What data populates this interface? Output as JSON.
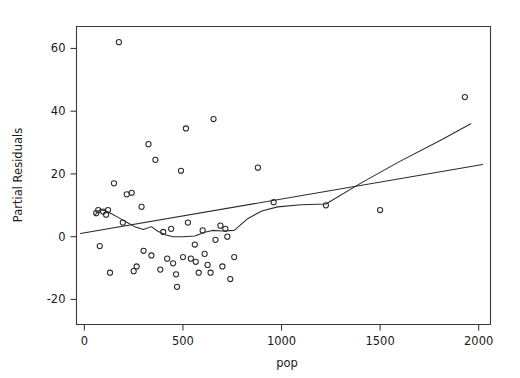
{
  "chart_data": {
    "type": "scatter",
    "title": "",
    "subtitle": "",
    "xlabel": "pop",
    "ylabel": "Partial Residuals",
    "xlim": [
      -40,
      2060
    ],
    "ylim": [
      -28,
      67
    ],
    "xticks": [
      0,
      500,
      1000,
      1500,
      2000
    ],
    "xticklabels": [
      "0",
      "500",
      "1000",
      "1500",
      "2000"
    ],
    "yticks": [
      -20,
      0,
      20,
      40,
      60
    ],
    "yticklabels": [
      "-20",
      "0",
      "20",
      "40",
      "60"
    ],
    "grid": false,
    "legend": null,
    "marker": "open-circle",
    "points": [
      {
        "x": 60,
        "y": 7.5
      },
      {
        "x": 70,
        "y": 8.5
      },
      {
        "x": 78,
        "y": -3.0
      },
      {
        "x": 95,
        "y": 8.0
      },
      {
        "x": 110,
        "y": 7.0
      },
      {
        "x": 120,
        "y": 8.5
      },
      {
        "x": 130,
        "y": -11.5
      },
      {
        "x": 150,
        "y": 17.0
      },
      {
        "x": 175,
        "y": 62.0
      },
      {
        "x": 195,
        "y": 4.5
      },
      {
        "x": 215,
        "y": 13.5
      },
      {
        "x": 240,
        "y": 14.0
      },
      {
        "x": 250,
        "y": -11.0
      },
      {
        "x": 265,
        "y": -9.5
      },
      {
        "x": 290,
        "y": 9.5
      },
      {
        "x": 300,
        "y": -4.5
      },
      {
        "x": 325,
        "y": 29.5
      },
      {
        "x": 340,
        "y": -6.0
      },
      {
        "x": 360,
        "y": 24.5
      },
      {
        "x": 385,
        "y": -10.5
      },
      {
        "x": 400,
        "y": 1.5
      },
      {
        "x": 420,
        "y": -7.0
      },
      {
        "x": 440,
        "y": 2.5
      },
      {
        "x": 450,
        "y": -8.5
      },
      {
        "x": 465,
        "y": -12.0
      },
      {
        "x": 470,
        "y": -16.0
      },
      {
        "x": 490,
        "y": 21.0
      },
      {
        "x": 500,
        "y": -6.5
      },
      {
        "x": 515,
        "y": 34.5
      },
      {
        "x": 525,
        "y": 4.5
      },
      {
        "x": 540,
        "y": -7.0
      },
      {
        "x": 560,
        "y": -2.5
      },
      {
        "x": 565,
        "y": -8.0
      },
      {
        "x": 580,
        "y": -11.5
      },
      {
        "x": 600,
        "y": 2.0
      },
      {
        "x": 610,
        "y": -5.5
      },
      {
        "x": 625,
        "y": -9.0
      },
      {
        "x": 640,
        "y": -11.5
      },
      {
        "x": 655,
        "y": 37.5
      },
      {
        "x": 665,
        "y": -1.0
      },
      {
        "x": 690,
        "y": 3.5
      },
      {
        "x": 700,
        "y": -9.5
      },
      {
        "x": 715,
        "y": 2.5
      },
      {
        "x": 725,
        "y": 0.0
      },
      {
        "x": 740,
        "y": -13.5
      },
      {
        "x": 760,
        "y": -6.5
      },
      {
        "x": 880,
        "y": 22.0
      },
      {
        "x": 960,
        "y": 11.0
      },
      {
        "x": 1225,
        "y": 10.0
      },
      {
        "x": 1500,
        "y": 8.5
      },
      {
        "x": 1930,
        "y": 44.5
      }
    ],
    "series": [
      {
        "name": "linear-fit",
        "type": "line",
        "points": [
          {
            "x": -20,
            "y": 1.0
          },
          {
            "x": 2020,
            "y": 23.0
          }
        ]
      },
      {
        "name": "smoother",
        "type": "line",
        "points": [
          {
            "x": 55,
            "y": 7.0
          },
          {
            "x": 80,
            "y": 8.6
          },
          {
            "x": 110,
            "y": 8.2
          },
          {
            "x": 140,
            "y": 7.2
          },
          {
            "x": 175,
            "y": 6.0
          },
          {
            "x": 215,
            "y": 4.6
          },
          {
            "x": 255,
            "y": 3.2
          },
          {
            "x": 300,
            "y": 2.3
          },
          {
            "x": 340,
            "y": 3.2
          },
          {
            "x": 370,
            "y": 1.8
          },
          {
            "x": 410,
            "y": 0.6
          },
          {
            "x": 450,
            "y": 0.0
          },
          {
            "x": 500,
            "y": 0.0
          },
          {
            "x": 560,
            "y": 0.2
          },
          {
            "x": 610,
            "y": 1.4
          },
          {
            "x": 650,
            "y": 2.0
          },
          {
            "x": 700,
            "y": 1.8
          },
          {
            "x": 760,
            "y": 2.0
          },
          {
            "x": 830,
            "y": 5.8
          },
          {
            "x": 900,
            "y": 8.2
          },
          {
            "x": 980,
            "y": 9.5
          },
          {
            "x": 1100,
            "y": 10.2
          },
          {
            "x": 1225,
            "y": 10.4
          },
          {
            "x": 1400,
            "y": 17.0
          },
          {
            "x": 1600,
            "y": 24.0
          },
          {
            "x": 1800,
            "y": 30.5
          },
          {
            "x": 1960,
            "y": 36.0
          }
        ]
      }
    ],
    "colors": {
      "axis": "#3a3a3a",
      "marker": "#2b2b2b",
      "line": "#2b2b2b",
      "background": "#ffffff"
    }
  }
}
